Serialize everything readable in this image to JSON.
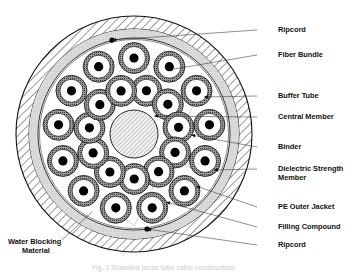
{
  "figure": {
    "caption": "Fig. 1  Stranded loose tube cable construction"
  },
  "labels": {
    "right": [
      {
        "id": "ripcord-top",
        "text": "Ripcord",
        "x": 278,
        "y": 31.5,
        "leader_x": 257,
        "leader_y": 30,
        "target_x": 112,
        "target_y": 40
      },
      {
        "id": "fiber-bundle",
        "text": "Fiber Bundle",
        "x": 278,
        "y": 56.5,
        "leader_x": 257,
        "leader_y": 55,
        "target_x": 168,
        "target_y": 70
      },
      {
        "id": "buffer-tube",
        "text": "Buffer Tube",
        "x": 278,
        "y": 97.5,
        "leader_x": 257,
        "leader_y": 96,
        "target_x": 204,
        "target_y": 97
      },
      {
        "id": "central-member",
        "text": "Central Member",
        "x": 278,
        "y": 118.5,
        "leader_x": 257,
        "leader_y": 117,
        "target_x": 154,
        "target_y": 116
      },
      {
        "id": "binder",
        "text": "Binder",
        "x": 278,
        "y": 148.5,
        "leader_x": 257,
        "leader_y": 147,
        "target_x": 191,
        "target_y": 135
      },
      {
        "id": "dielectric-strength-member-line1",
        "text": "Dielectric Strength",
        "x": 278,
        "y": 170.5,
        "leader_x": 257,
        "leader_y": 169,
        "target_x": 214,
        "target_y": 170
      },
      {
        "id": "dielectric-strength-member-line2",
        "text": "Member",
        "x": 278,
        "y": 179.5,
        "leader_x": null,
        "leader_y": null,
        "target_x": null,
        "target_y": null
      },
      {
        "id": "pe-outer-jacket",
        "text": "PE Outer Jacket",
        "x": 278,
        "y": 208.5,
        "leader_x": 257,
        "leader_y": 207,
        "target_x": 196,
        "target_y": 186
      },
      {
        "id": "filling-compound",
        "text": "Filling Compound",
        "x": 278,
        "y": 228.5,
        "leader_x": 257,
        "leader_y": 227,
        "target_x": 166,
        "target_y": 202
      },
      {
        "id": "ripcord-bottom",
        "text": "Ripcord",
        "x": 278,
        "y": 246.5,
        "leader_x": 257,
        "leader_y": 245,
        "target_x": 147,
        "target_y": 229
      }
    ],
    "left": [
      {
        "id": "water-blocking-material-line1",
        "text": "Water Blocking",
        "x": 8,
        "y": 243.5
      },
      {
        "id": "water-blocking-material-line2",
        "text": "Material",
        "x": 22,
        "y": 252.5
      }
    ]
  },
  "diagram": {
    "center_x": 134,
    "center_y": 134,
    "jacket_outer_r": 118,
    "jacket_inner_r": 105,
    "filling_outer_r": 105,
    "filling_inner_r": 96,
    "binder_r": 95,
    "core_r": 94,
    "central_member_r": 24,
    "buffer_tube_outer_r": 15.5,
    "buffer_tube_inner_r": 11.5,
    "fiber_bundle_r": 4.6,
    "outer_ring_count": 13,
    "inner_ring_count": 11,
    "outer_ring_radius": 76,
    "inner_ring_radius": 45,
    "ripcord_top": {
      "x": 112,
      "y": 40,
      "r": 2.6
    },
    "ripcord_bottom": {
      "x": 147,
      "y": 229,
      "r": 2.6
    }
  },
  "colors": {
    "line": "#111111",
    "hatch": "#555555",
    "jacket_fill": "#ffffff",
    "filling_fill": "#dcdcdc",
    "buffer_tube_fill": "#8c8c8c",
    "tube_inner_fill": "#ffffff",
    "fiber_fill": "#000000",
    "central_member_fill": "#efefef",
    "background": "#ffffff",
    "text": "#111111"
  }
}
